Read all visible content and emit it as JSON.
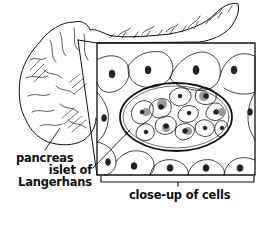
{
  "figure": {
    "colors": {
      "ink": "#111111",
      "background": "#ffffff",
      "stipple": "#777777"
    }
  },
  "labels": {
    "pancreas": "pancreas",
    "islet_line1": "islet of",
    "islet_line2": "Langerhans",
    "closeup": "close-up of cells"
  }
}
